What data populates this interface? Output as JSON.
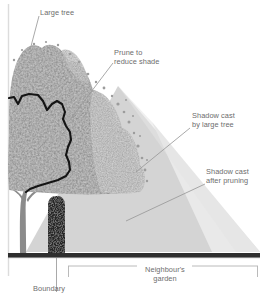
{
  "figure": {
    "width": 267,
    "height": 299,
    "background": "#ffffff"
  },
  "labels": {
    "large_tree": "Large tree",
    "prune": "Prune to\nreduce shade",
    "shadow_large_tree": "Shadow cast\nby large tree",
    "shadow_after_pruning": "Shadow cast\nafter pruning",
    "neighbours_garden": "Neighbour's\ngarden",
    "boundary": "Boundary"
  },
  "colors": {
    "canopy": "#8c8c8c",
    "canopy_light": "#b5b5b5",
    "trunk": "#8c8c8c",
    "shadow_large": "#d2d2d2",
    "shadow_pruned": "#e6e6e6",
    "ground_line": "#2e2e2e",
    "hedge": "#2a2a2a",
    "prune_outline": "#111111",
    "leader_line": "#9a9a9a",
    "bracket_line": "#b0b0b0",
    "label_text": "#6d6d6d",
    "left_border": "#d8d8d8",
    "background": "#ffffff"
  },
  "geometry": {
    "ground_y": 254,
    "ground_x_start": 8,
    "ground_x_end": 260,
    "hedge": {
      "x": 48,
      "y": 196,
      "width": 17,
      "height": 58
    },
    "trunk_x": 22,
    "shadow_apex": {
      "x": 20,
      "y": 80
    },
    "shadow_large_ground_end": 260,
    "shadow_pruned_ground_end": 215,
    "bracket": {
      "x_start": 68,
      "x_end": 258,
      "y": 266
    }
  },
  "elements": {
    "large_tree": "large-tree",
    "boundary_hedge": "boundary-hedge",
    "ground": "ground-line",
    "shadow_large": "shadow-wedge-large-tree",
    "shadow_pruned": "shadow-wedge-after-pruning",
    "prune_outline": "prune-outline-path"
  }
}
